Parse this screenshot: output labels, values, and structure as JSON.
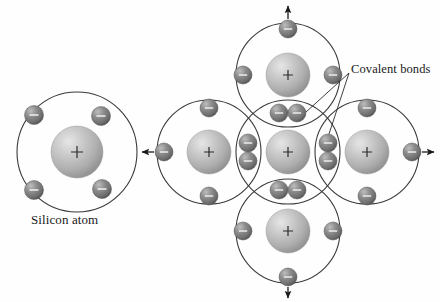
{
  "figure": {
    "title_left": "Silicon atom",
    "annotation_right": "Covalent bonds",
    "nucleus_symbol": "+",
    "electron_symbol": "–",
    "background_color": "#fefefe",
    "nucleus_color": "#b4b4b4",
    "nucleus_highlight_color": "#e2e2e2",
    "nucleus_shadow_color": "#8a8a8a",
    "electron_color": "#7d7d7d",
    "electron_highlight_color": "#b9b9b9",
    "electron_shadow_color": "#4a4a4a",
    "orbit_stroke_color": "#3a3a3a",
    "arrow_color": "#1a1a1a",
    "leader_line_color": "#2a2a2a"
  },
  "left_atom": {
    "name": "Silicon atom",
    "label": "Silicon atom",
    "center": {
      "x": 77,
      "y": 152
    },
    "orbit_radius": 60,
    "nucleus_radius": 26,
    "nucleus_charge": "+",
    "electron_count": 4,
    "electrons": [
      {
        "position": "top-left",
        "x": 34,
        "y": 115,
        "charge": "–"
      },
      {
        "position": "top-right",
        "x": 101,
        "y": 116,
        "charge": "–"
      },
      {
        "position": "bottom-left",
        "x": 34,
        "y": 190,
        "charge": "–"
      },
      {
        "position": "bottom-right",
        "x": 102,
        "y": 189,
        "charge": "–"
      }
    ]
  },
  "lattice": {
    "annotation": "Covalent bonds",
    "atom_count": 5,
    "orbit_radius": 52,
    "nucleus_radius": 22,
    "atoms": [
      {
        "name": "center-atom",
        "role": "center",
        "center": {
          "x": 288,
          "y": 152
        },
        "charge": "+"
      },
      {
        "name": "top-atom",
        "role": "neighbor-top",
        "center": {
          "x": 288,
          "y": 75
        },
        "charge": "+"
      },
      {
        "name": "bottom-atom",
        "role": "neighbor-bottom",
        "center": {
          "x": 288,
          "y": 231
        },
        "charge": "+"
      },
      {
        "name": "left-atom",
        "role": "neighbor-left",
        "center": {
          "x": 209,
          "y": 152
        },
        "charge": "+"
      },
      {
        "name": "right-atom",
        "role": "neighbor-right",
        "center": {
          "x": 367,
          "y": 152
        },
        "charge": "+"
      }
    ],
    "shared_electron_pairs": [
      {
        "name": "bond-top",
        "orientation": "horizontal",
        "x": 288,
        "y": 113,
        "charge": "–"
      },
      {
        "name": "bond-bottom",
        "orientation": "horizontal",
        "x": 288,
        "y": 190,
        "charge": "–"
      },
      {
        "name": "bond-left",
        "orientation": "vertical",
        "x": 248,
        "y": 152,
        "charge": "–"
      },
      {
        "name": "bond-right",
        "orientation": "vertical",
        "x": 328,
        "y": 152,
        "charge": "–"
      }
    ],
    "outer_electrons": [
      {
        "name": "top-atom-top-electron",
        "x": 288,
        "y": 37,
        "charge": "–"
      },
      {
        "name": "top-atom-left-electron",
        "x": 251,
        "y": 75,
        "charge": "–"
      },
      {
        "name": "top-atom-right-electron",
        "x": 325,
        "y": 75,
        "charge": "–"
      },
      {
        "name": "bottom-atom-bottom-electron",
        "x": 288,
        "y": 269,
        "charge": "–"
      },
      {
        "name": "bottom-atom-left-electron",
        "x": 251,
        "y": 231,
        "charge": "–"
      },
      {
        "name": "bottom-atom-right-electron",
        "x": 325,
        "y": 231,
        "charge": "–"
      },
      {
        "name": "left-atom-left-electron",
        "x": 171,
        "y": 152,
        "charge": "–"
      },
      {
        "name": "left-atom-top-electron",
        "x": 209,
        "y": 115,
        "charge": "–"
      },
      {
        "name": "left-atom-bottom-electron",
        "x": 209,
        "y": 189,
        "charge": "–"
      },
      {
        "name": "right-atom-right-electron",
        "x": 405,
        "y": 152,
        "charge": "–"
      },
      {
        "name": "right-atom-top-electron",
        "x": 367,
        "y": 115,
        "charge": "–"
      },
      {
        "name": "right-atom-bottom-electron",
        "x": 367,
        "y": 189,
        "charge": "–"
      }
    ],
    "bond_arrows": [
      {
        "name": "arrow-up",
        "direction": "up",
        "from": {
          "x": 288,
          "y": 30
        },
        "to": {
          "x": 288,
          "y": 8
        }
      },
      {
        "name": "arrow-down",
        "direction": "down",
        "from": {
          "x": 288,
          "y": 276
        },
        "to": {
          "x": 288,
          "y": 296
        }
      },
      {
        "name": "arrow-left",
        "direction": "left",
        "from": {
          "x": 164,
          "y": 152
        },
        "to": {
          "x": 142,
          "y": 152
        }
      },
      {
        "name": "arrow-right",
        "direction": "right",
        "from": {
          "x": 412,
          "y": 152
        },
        "to": {
          "x": 434,
          "y": 152
        }
      }
    ],
    "leader_lines": [
      {
        "name": "leader-to-top-bond",
        "from": {
          "x": 349,
          "y": 74
        },
        "to": {
          "x": 300,
          "y": 113
        }
      },
      {
        "name": "leader-to-right-bond",
        "from": {
          "x": 349,
          "y": 74
        },
        "to": {
          "x": 328,
          "y": 143
        }
      }
    ]
  }
}
